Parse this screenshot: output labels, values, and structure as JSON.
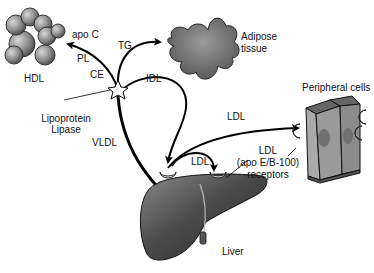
{
  "diagram": {
    "labels": {
      "hdl": "HDL",
      "apo_c": "apo C",
      "pl": "PL",
      "ce": "CE",
      "tg": "TG",
      "adipose_line1": "Adipose",
      "adipose_line2": "tissue",
      "idl": "IDL",
      "lipase_line1": "Lipoprotein",
      "lipase_line2": "Lipase",
      "vldl": "VLDL",
      "ldl_to_cells": "LDL",
      "ldl_to_liver": "LDL",
      "peripheral_cells": "Peripheral cells",
      "receptor_line1": "LDL",
      "receptor_line2": "(apo E/B-100)",
      "receptor_line3": "receptors",
      "liver": "Liver"
    },
    "nodes": [
      {
        "id": "hdl",
        "label": "HDL"
      },
      {
        "id": "adipose",
        "label": "Adipose tissue"
      },
      {
        "id": "lipase",
        "label": "Lipoprotein Lipase"
      },
      {
        "id": "liver",
        "label": "Liver"
      },
      {
        "id": "peripheral",
        "label": "Peripheral cells"
      }
    ],
    "edges": [
      {
        "from": "liver",
        "to": "lipase",
        "label": "VLDL"
      },
      {
        "from": "lipase",
        "to": "hdl",
        "label": "PL / CE / apo C"
      },
      {
        "from": "lipase",
        "to": "adipose",
        "label": "TG"
      },
      {
        "from": "lipase",
        "to": "liver",
        "label": "IDL"
      },
      {
        "from": "liver",
        "to": "peripheral",
        "label": "LDL"
      },
      {
        "from": "liver",
        "to": "liver-receptor",
        "label": "LDL"
      }
    ],
    "colors": {
      "sphere": "#8a8a8a",
      "adipose": "#6e6e6e",
      "liver": "#555555",
      "cells": "#9a9a9a",
      "nucleus": "#707070",
      "arrow": "#000000"
    }
  }
}
